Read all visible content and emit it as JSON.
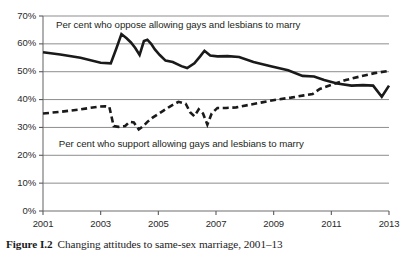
{
  "caption": {
    "label": "Figure I.2",
    "text": "Changing attitudes to same-sex marriage, 2001–13"
  },
  "chart_data": {
    "type": "line",
    "title": "Changing attitudes to same-sex marriage, 2001–13",
    "xlabel": "",
    "ylabel": "",
    "xlim": [
      2001,
      2013
    ],
    "ylim": [
      0,
      70
    ],
    "grid": true,
    "grid_axis": "y",
    "legend_position": "inline-annotation",
    "x_tick_labels": [
      "2001",
      "2003",
      "2005",
      "2007",
      "2009",
      "2011",
      "2013"
    ],
    "x_tick_values": [
      2001,
      2003,
      2005,
      2007,
      2009,
      2011,
      2013
    ],
    "y_tick_labels": [
      "0%",
      "10%",
      "20%",
      "30%",
      "40%",
      "50%",
      "60%",
      "70%"
    ],
    "y_tick_values": [
      0,
      10,
      20,
      30,
      40,
      50,
      60,
      70
    ],
    "annotations": [
      {
        "name": "oppose-label",
        "text": "Per cent who oppose allowing gays and lesbians to marry",
        "x": 2001.45,
        "y": 66.5
      },
      {
        "name": "support-label",
        "text": "Per cent who support allowing gays and lesbians to marry",
        "x": 2001.55,
        "y": 23.8
      }
    ],
    "series": [
      {
        "name": "Per cent who oppose allowing gays and lesbians to marry",
        "style": "solid",
        "color": "#1a1a1a",
        "width": 2.6,
        "x": [
          2001.0,
          2001.6,
          2002.3,
          2003.0,
          2003.35,
          2003.55,
          2003.72,
          2003.9,
          2004.05,
          2004.2,
          2004.35,
          2004.5,
          2004.62,
          2004.75,
          2004.88,
          2005.05,
          2005.25,
          2005.5,
          2005.8,
          2006.0,
          2006.25,
          2006.45,
          2006.6,
          2006.8,
          2007.05,
          2007.4,
          2007.8,
          2008.3,
          2008.9,
          2009.5,
          2010.0,
          2010.4,
          2010.75,
          2011.2,
          2011.7,
          2012.1,
          2012.45,
          2012.75,
          2013.0
        ],
        "y": [
          57.0,
          56.2,
          55.0,
          53.2,
          53.0,
          58.5,
          63.5,
          62.0,
          60.5,
          58.5,
          56.0,
          61.0,
          61.5,
          60.0,
          58.0,
          56.0,
          54.0,
          53.5,
          52.0,
          51.3,
          53.0,
          55.5,
          57.5,
          55.8,
          55.5,
          55.6,
          55.3,
          53.5,
          52.0,
          50.5,
          48.5,
          48.3,
          47.0,
          45.8,
          45.0,
          45.2,
          45.0,
          41.0,
          45.0
        ]
      },
      {
        "name": "Per cent who support allowing gays and lesbians to marry",
        "style": "dashed",
        "color": "#1a1a1a",
        "width": 2.6,
        "dash_pattern": [
          6,
          3.6
        ],
        "x": [
          2001.0,
          2001.6,
          2002.3,
          2002.95,
          2003.15,
          2003.3,
          2003.45,
          2003.62,
          2003.85,
          2004.0,
          2004.15,
          2004.32,
          2004.48,
          2004.62,
          2004.8,
          2005.1,
          2005.4,
          2005.7,
          2005.95,
          2006.1,
          2006.25,
          2006.4,
          2006.55,
          2006.7,
          2006.85,
          2007.05,
          2007.35,
          2007.7,
          2008.1,
          2008.6,
          2009.1,
          2009.6,
          2010.05,
          2010.35,
          2010.6,
          2011.0,
          2011.5,
          2012.0,
          2012.5,
          2013.0
        ],
        "y": [
          35.0,
          35.6,
          36.5,
          37.5,
          37.6,
          37.4,
          30.5,
          30.2,
          30.5,
          32.0,
          31.8,
          29.3,
          30.5,
          32.0,
          33.5,
          35.5,
          37.5,
          39.2,
          38.5,
          35.5,
          34.0,
          36.5,
          35.0,
          31.0,
          35.0,
          37.0,
          37.0,
          37.2,
          38.0,
          39.0,
          40.0,
          40.7,
          41.5,
          42.0,
          43.8,
          45.3,
          47.0,
          48.3,
          49.5,
          50.3
        ]
      }
    ]
  }
}
